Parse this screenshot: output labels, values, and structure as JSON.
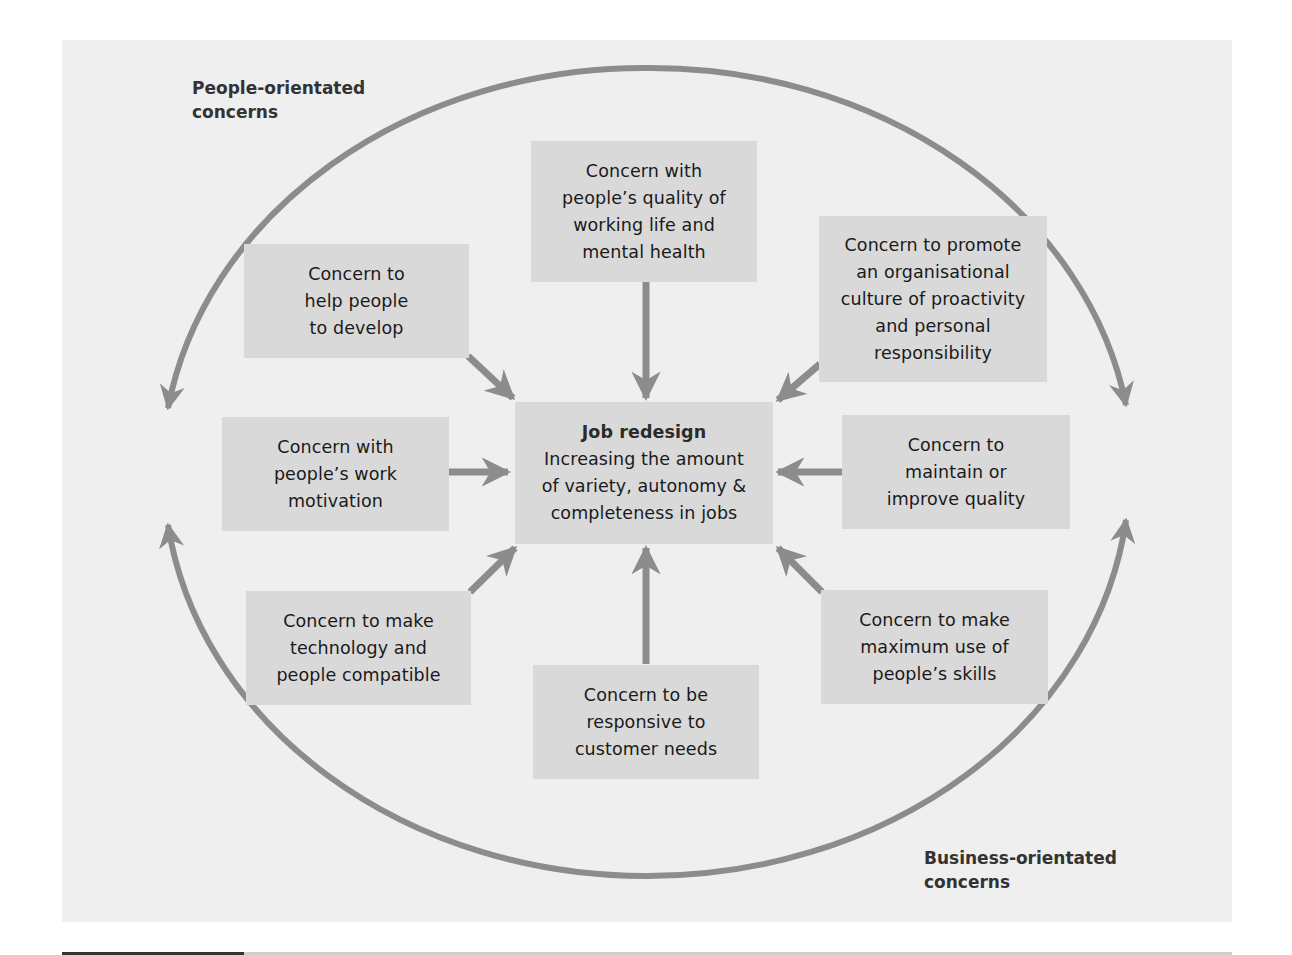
{
  "diagram": {
    "title_labels": {
      "people": [
        "People-orientated",
        "concerns"
      ],
      "business": [
        "Business-orientated",
        "concerns"
      ]
    },
    "center": {
      "title": "Job redesign",
      "lines": [
        "Increasing the amount",
        "of variety, autonomy &",
        "completeness in jobs"
      ]
    },
    "concerns": [
      {
        "id": "quality-of-working-life",
        "lines": [
          "Concern with",
          "people’s quality of",
          "working life and",
          "mental health"
        ]
      },
      {
        "id": "help-develop",
        "lines": [
          "Concern to",
          "help people",
          "to develop"
        ]
      },
      {
        "id": "proactivity-culture",
        "lines": [
          "Concern to promote",
          "an organisational",
          "culture of proactivity",
          "and personal",
          "responsibility"
        ]
      },
      {
        "id": "work-motivation",
        "lines": [
          "Concern with",
          "people’s work",
          "motivation"
        ]
      },
      {
        "id": "quality",
        "lines": [
          "Concern to",
          "maintain or",
          "improve quality"
        ]
      },
      {
        "id": "technology-compatible",
        "lines": [
          "Concern to make",
          "technology and",
          "people compatible"
        ]
      },
      {
        "id": "customer-needs",
        "lines": [
          "Concern to be",
          "responsive to",
          "customer needs"
        ]
      },
      {
        "id": "skills",
        "lines": [
          "Concern to make",
          "maximum use of",
          "people’s skills"
        ]
      }
    ],
    "colors": {
      "background": "#efefef",
      "box_fill": "#d9d9d9",
      "arrow": "#8c8c8c",
      "text": "#1a1a1a",
      "label_text": "#333333"
    }
  }
}
